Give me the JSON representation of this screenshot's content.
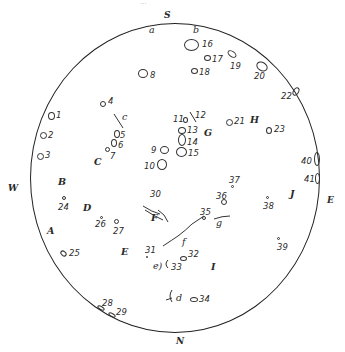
{
  "caption": "...",
  "cardinals": {
    "S": "S",
    "N": "N",
    "E": "E",
    "W": "W"
  },
  "regions": [
    "A",
    "B",
    "C",
    "D",
    "E",
    "F",
    "G",
    "H",
    "I",
    "J"
  ],
  "subregions": [
    "a",
    "b",
    "c",
    "d",
    "e)",
    "f",
    "g"
  ],
  "spots": [
    "1",
    "2",
    "3",
    "4",
    "5",
    "6",
    "7",
    "8",
    "9",
    "10",
    "11",
    "12",
    "13",
    "14",
    "15",
    "16",
    "17",
    "18",
    "19",
    "20",
    "21",
    "22",
    "23",
    "24",
    "25",
    "26",
    "27",
    "28",
    "29",
    "30",
    "31",
    "32",
    "33",
    "34",
    "35",
    "36",
    "37",
    "38",
    "39",
    "40",
    "41"
  ]
}
